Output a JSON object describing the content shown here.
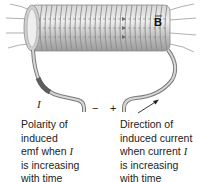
{
  "diagram": {
    "field_label": "B",
    "current_label": "I",
    "minus_sign": "−",
    "plus_sign": "+",
    "colors": {
      "coil": "#a8a8a8",
      "coil_dark": "#7a7a7a",
      "field_lines": "#9a9a9a",
      "text": "#222222",
      "wire_dark": "#6e6e6e"
    }
  },
  "captions": {
    "left": {
      "line1": "Polarity of",
      "line2": "induced",
      "line3_prefix": "emf when ",
      "line3_var": "I",
      "line4": "is increasing",
      "line5": "with time"
    },
    "right": {
      "line1": "Direction of",
      "line2": "induced current",
      "line3_prefix": "when current ",
      "line3_var": "I",
      "line4": "is increasing",
      "line5": "with time"
    }
  }
}
